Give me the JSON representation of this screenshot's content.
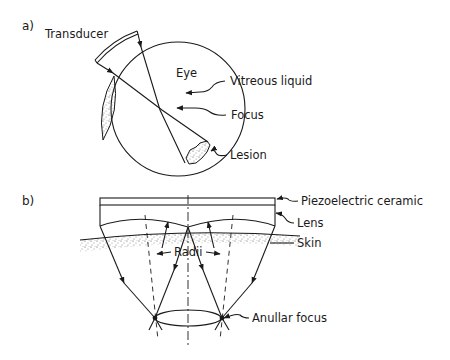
{
  "figure": {
    "panel_a": {
      "label": "a)",
      "labels": {
        "transducer": "Transducer",
        "eye": "Eye",
        "vitreous": "Vitreous liquid",
        "focus": "Focus",
        "lesion": "Lesion"
      }
    },
    "panel_b": {
      "label": "b)",
      "labels": {
        "piezo": "Piezoelectric ceramic",
        "lens": "Lens",
        "skin": "Skin",
        "radii": "Radii",
        "anullar_focus": "Anullar focus"
      }
    },
    "colors": {
      "ink": "#1a1a1a",
      "background": "#ffffff"
    }
  }
}
